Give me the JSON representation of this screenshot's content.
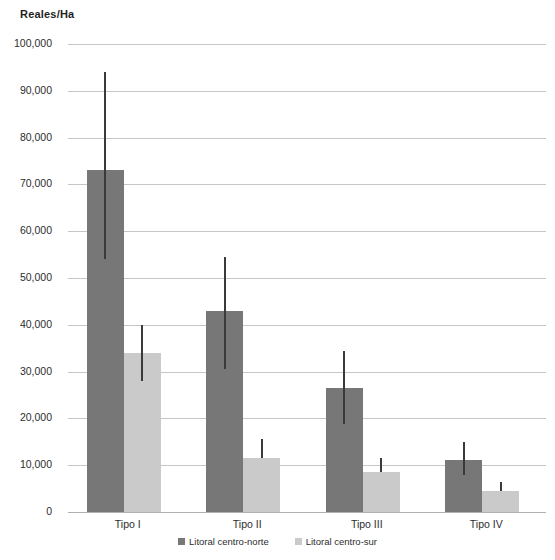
{
  "chart_data": {
    "type": "bar",
    "title": "Reales/Ha",
    "xlabel": "",
    "ylabel": "Reales/Ha",
    "ylim": [
      0,
      100000
    ],
    "ytick_step": 10000,
    "grid": true,
    "legend_position": "bottom",
    "categories": [
      "Tipo I",
      "Tipo II",
      "Tipo III",
      "Tipo IV"
    ],
    "ytick_labels": [
      "100,000",
      "90,000",
      "80,000",
      "70,000",
      "60,000",
      "50,000",
      "40,000",
      "30,000",
      "20,000",
      "10,000",
      "0"
    ],
    "ytick_values": [
      100000,
      90000,
      80000,
      70000,
      60000,
      50000,
      40000,
      30000,
      20000,
      10000,
      0
    ],
    "series": [
      {
        "name": "Litoral centro-norte",
        "color": "#777777",
        "values": [
          73000,
          43000,
          26500,
          11200
        ],
        "error_low": [
          54000,
          30500,
          18700,
          8000
        ],
        "error_high": [
          94000,
          54500,
          34500,
          15000
        ]
      },
      {
        "name": "Litoral centro-sur",
        "color": "#cacaca",
        "values": [
          34000,
          11500,
          8500,
          4500
        ],
        "error_low": [
          28000,
          11500,
          8500,
          4500
        ],
        "error_high": [
          40000,
          15500,
          11500,
          6500
        ]
      }
    ]
  },
  "colors": {
    "series_a": "#777777",
    "series_b": "#cacaca",
    "gridline": "#c6c6c6",
    "text": "#2d2d2d",
    "error": "#3a3a3a",
    "background": "#ffffff"
  }
}
